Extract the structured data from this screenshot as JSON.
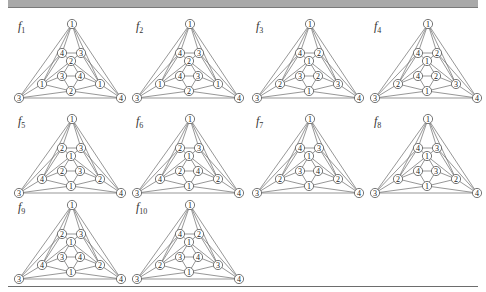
{
  "figure": {
    "colors": {
      "edge": "#6a6a6a",
      "node_stroke": "#555555",
      "node_fill": "#ffffff",
      "header_bar": "#a9a9a9",
      "rule": "#6d6d6d"
    }
  },
  "node_positions": {
    "top": [
      58,
      11
    ],
    "ul": [
      48,
      40
    ],
    "ur": [
      67,
      40
    ],
    "mid": [
      57,
      48
    ],
    "il": [
      48,
      63
    ],
    "ir": [
      66,
      63
    ],
    "sl": [
      28,
      71
    ],
    "sr": [
      86,
      71
    ],
    "bot": [
      57,
      78
    ],
    "outl": [
      5,
      85
    ],
    "outr": [
      107,
      85
    ]
  },
  "edges": [
    [
      "top",
      "ul"
    ],
    [
      "top",
      "ur"
    ],
    [
      "top",
      "outl"
    ],
    [
      "top",
      "outr"
    ],
    [
      "top",
      "sl"
    ],
    [
      "top",
      "sr"
    ],
    [
      "ul",
      "ur"
    ],
    [
      "ul",
      "mid"
    ],
    [
      "ur",
      "mid"
    ],
    [
      "ul",
      "outl"
    ],
    [
      "ul",
      "sl"
    ],
    [
      "ur",
      "outr"
    ],
    [
      "ur",
      "sr"
    ],
    [
      "mid",
      "il"
    ],
    [
      "mid",
      "ir"
    ],
    [
      "mid",
      "sl"
    ],
    [
      "mid",
      "sr"
    ],
    [
      "il",
      "ir"
    ],
    [
      "il",
      "sl"
    ],
    [
      "ir",
      "sr"
    ],
    [
      "il",
      "bot"
    ],
    [
      "ir",
      "bot"
    ],
    [
      "sl",
      "bot"
    ],
    [
      "sr",
      "bot"
    ],
    [
      "sl",
      "outl"
    ],
    [
      "sr",
      "outr"
    ],
    [
      "bot",
      "outl"
    ],
    [
      "bot",
      "outr"
    ],
    [
      "outl",
      "outr"
    ]
  ],
  "panels": [
    {
      "name": "f1",
      "label_main": "f",
      "label_sub": "1",
      "left": 8,
      "top": 9,
      "labels": {
        "top": "1",
        "ul": "4",
        "ur": "3",
        "mid": "2",
        "il": "3",
        "ir": "4",
        "sl": "1",
        "sr": "1",
        "bot": "2",
        "outl": "3",
        "outr": "4"
      }
    },
    {
      "name": "f2",
      "label_main": "f",
      "label_sub": "2",
      "left": 126,
      "top": 9,
      "labels": {
        "top": "1",
        "ul": "4",
        "ur": "3",
        "mid": "2",
        "il": "4",
        "ir": "3",
        "sl": "1",
        "sr": "1",
        "bot": "2",
        "outl": "3",
        "outr": "4"
      }
    },
    {
      "name": "f3",
      "label_main": "f",
      "label_sub": "3",
      "left": 246,
      "top": 9,
      "labels": {
        "top": "1",
        "ul": "4",
        "ur": "2",
        "mid": "1",
        "il": "3",
        "ir": "2",
        "sl": "2",
        "sr": "3",
        "bot": "1",
        "outl": "3",
        "outr": "4"
      }
    },
    {
      "name": "f4",
      "label_main": "f",
      "label_sub": "4",
      "left": 364,
      "top": 9,
      "labels": {
        "top": "1",
        "ul": "4",
        "ur": "2",
        "mid": "1",
        "il": "4",
        "ir": "2",
        "sl": "2",
        "sr": "3",
        "bot": "1",
        "outl": "3",
        "outr": "4"
      }
    },
    {
      "name": "f5",
      "label_main": "f",
      "label_sub": "5",
      "left": 8,
      "top": 104,
      "labels": {
        "top": "1",
        "ul": "2",
        "ur": "3",
        "mid": "1",
        "il": "2",
        "ir": "3",
        "sl": "4",
        "sr": "2",
        "bot": "1",
        "outl": "3",
        "outr": "4"
      }
    },
    {
      "name": "f6",
      "label_main": "f",
      "label_sub": "6",
      "left": 126,
      "top": 104,
      "labels": {
        "top": "1",
        "ul": "2",
        "ur": "3",
        "mid": "1",
        "il": "2",
        "ir": "4",
        "sl": "4",
        "sr": "2",
        "bot": "1",
        "outl": "3",
        "outr": "4"
      }
    },
    {
      "name": "f7",
      "label_main": "f",
      "label_sub": "7",
      "left": 246,
      "top": 104,
      "labels": {
        "top": "1",
        "ul": "4",
        "ur": "3",
        "mid": "1",
        "il": "3",
        "ir": "4",
        "sl": "2",
        "sr": "2",
        "bot": "1",
        "outl": "3",
        "outr": "4"
      }
    },
    {
      "name": "f8",
      "label_main": "f",
      "label_sub": "8",
      "left": 364,
      "top": 104,
      "labels": {
        "top": "1",
        "ul": "4",
        "ur": "3",
        "mid": "1",
        "il": "4",
        "ir": "3",
        "sl": "2",
        "sr": "2",
        "bot": "1",
        "outl": "3",
        "outr": "4"
      }
    },
    {
      "name": "f9",
      "label_main": "f",
      "label_sub": "9",
      "left": 8,
      "top": 190,
      "labels": {
        "top": "1",
        "ul": "2",
        "ur": "3",
        "mid": "1",
        "il": "3",
        "ir": "4",
        "sl": "4",
        "sr": "2",
        "bot": "1",
        "outl": "3",
        "outr": "4"
      }
    },
    {
      "name": "f10",
      "label_main": "f",
      "label_sub": "10",
      "left": 126,
      "top": 190,
      "labels": {
        "top": "1",
        "ul": "4",
        "ur": "2",
        "mid": "1",
        "il": "3",
        "ir": "4",
        "sl": "2",
        "sr": "3",
        "bot": "1",
        "outl": "3",
        "outr": "4"
      }
    }
  ]
}
